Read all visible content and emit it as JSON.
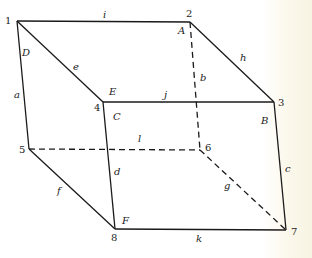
{
  "diagram": {
    "type": "box-wireframe",
    "vertices": [
      {
        "id": "1",
        "x": 17,
        "y": 21,
        "lx": 5,
        "ly": 24
      },
      {
        "id": "2",
        "x": 190,
        "y": 22,
        "lx": 186,
        "ly": 17
      },
      {
        "id": "3",
        "x": 274,
        "y": 102,
        "lx": 278,
        "ly": 106
      },
      {
        "id": "4",
        "x": 103,
        "y": 102,
        "lx": 94,
        "ly": 111
      },
      {
        "id": "5",
        "x": 29,
        "y": 149,
        "lx": 19,
        "ly": 153
      },
      {
        "id": "6",
        "x": 200,
        "y": 150,
        "lx": 205,
        "ly": 151
      },
      {
        "id": "7",
        "x": 286,
        "y": 230,
        "lx": 291,
        "ly": 235
      },
      {
        "id": "8",
        "x": 115,
        "y": 229,
        "lx": 111,
        "ly": 241
      }
    ],
    "edges": [
      {
        "id": "i",
        "from": "1",
        "to": "2",
        "dashed": false,
        "lx": 103,
        "ly": 18
      },
      {
        "id": "h",
        "from": "2",
        "to": "3",
        "dashed": false,
        "lx": 240,
        "ly": 61
      },
      {
        "id": "j",
        "from": "4",
        "to": "3",
        "dashed": false,
        "lx": 164,
        "ly": 98
      },
      {
        "id": "e",
        "from": "1",
        "to": "4",
        "dashed": false,
        "lx": 73,
        "ly": 70
      },
      {
        "id": "a",
        "from": "1",
        "to": "5",
        "dashed": false,
        "lx": 14,
        "ly": 98
      },
      {
        "id": "d",
        "from": "4",
        "to": "8",
        "dashed": false,
        "lx": 114,
        "ly": 175
      },
      {
        "id": "c",
        "from": "3",
        "to": "7",
        "dashed": false,
        "lx": 285,
        "ly": 172
      },
      {
        "id": "f",
        "from": "5",
        "to": "8",
        "dashed": false,
        "lx": 57,
        "ly": 194
      },
      {
        "id": "k",
        "from": "8",
        "to": "7",
        "dashed": false,
        "lx": 196,
        "ly": 242
      },
      {
        "id": "b",
        "from": "2",
        "to": "6",
        "dashed": true,
        "lx": 200,
        "ly": 81
      },
      {
        "id": "l",
        "from": "5",
        "to": "6",
        "dashed": true,
        "lx": 138,
        "ly": 142
      },
      {
        "id": "g",
        "from": "6",
        "to": "7",
        "dashed": true,
        "lx": 224,
        "ly": 189
      }
    ],
    "face_labels": [
      {
        "id": "A",
        "x": 178,
        "y": 34
      },
      {
        "id": "B",
        "x": 261,
        "y": 124
      },
      {
        "id": "C",
        "x": 113,
        "y": 120
      },
      {
        "id": "D",
        "x": 22,
        "y": 56
      },
      {
        "id": "E",
        "x": 109,
        "y": 95
      },
      {
        "id": "F",
        "x": 122,
        "y": 224
      }
    ]
  }
}
